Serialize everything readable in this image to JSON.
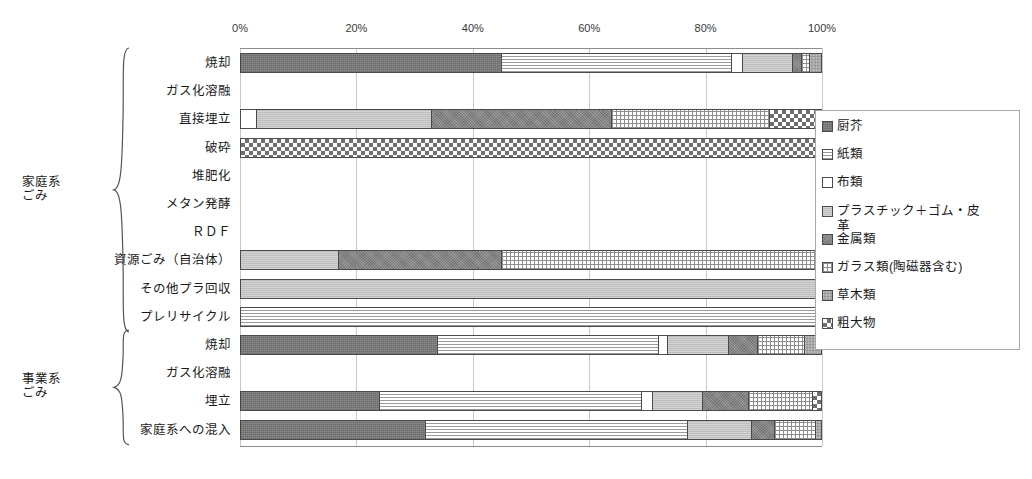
{
  "axis": {
    "tick_labels": [
      "0%",
      "20%",
      "40%",
      "60%",
      "80%",
      "100%"
    ],
    "tick_values": [
      0,
      20,
      40,
      60,
      80,
      100
    ],
    "min": 0,
    "max": 100
  },
  "groups": [
    {
      "label": "家庭系\nごみ",
      "first_row": 0,
      "last_row": 9
    },
    {
      "label": "事業系\nごみ",
      "first_row": 10,
      "last_row": 13
    }
  ],
  "legend": {
    "items": [
      {
        "label": "厨芥",
        "key": "kitchen",
        "swatch": "p-kitchen",
        "color": "#8a8a8a"
      },
      {
        "label": "紙類",
        "key": "paper",
        "swatch": "p-paper",
        "color": "#ffffff"
      },
      {
        "label": "布類",
        "key": "cloth",
        "swatch": "p-cloth",
        "color": "#ffffff"
      },
      {
        "label": "プラスチック＋ゴム・皮\n革",
        "key": "plastic",
        "swatch": "p-plastic",
        "color": "#bdbdbd"
      },
      {
        "label": "金属類",
        "key": "metal",
        "swatch": "p-metal",
        "color": "#9a9a9a"
      },
      {
        "label": "ガラス類(陶磁器含む)",
        "key": "glass",
        "swatch": "p-glass",
        "color": "#ffffff"
      },
      {
        "label": "草木類",
        "key": "wood",
        "swatch": "p-wood",
        "color": "#a8a8a8"
      },
      {
        "label": "粗大物",
        "key": "bulky",
        "swatch": "p-bulky",
        "color": "#6f6f6f"
      }
    ]
  },
  "chart_data": {
    "type": "bar",
    "orientation": "horizontal",
    "stacked": true,
    "normalized_percent": true,
    "title": "",
    "xlabel": "",
    "ylabel": "",
    "xlim": [
      0,
      100
    ],
    "grid": true,
    "legend_position": "right",
    "series": [
      {
        "name": "厨芥",
        "key": "kitchen",
        "values": [
          45.0,
          0,
          0,
          0,
          0,
          0,
          0,
          0,
          0,
          0,
          34.0,
          0,
          24.0,
          32.0
        ]
      },
      {
        "name": "紙類",
        "key": "paper",
        "values": [
          39.5,
          0,
          0,
          0,
          0,
          0,
          0,
          0,
          0,
          100,
          38.0,
          0,
          45.0,
          45.0
        ]
      },
      {
        "name": "布類",
        "key": "cloth",
        "values": [
          2.0,
          0,
          3.0,
          0,
          0,
          0,
          0,
          0,
          0,
          0,
          1.5,
          0,
          2.0,
          0.0
        ]
      },
      {
        "name": "プラスチック＋ゴム・皮革",
        "key": "plastic",
        "swatch": "p-plastic",
        "values": [
          8.5,
          0,
          30.0,
          0,
          0,
          0,
          0,
          17.0,
          100,
          0,
          10.5,
          0,
          8.5,
          11.0
        ]
      },
      {
        "name": "金属類",
        "key": "metal",
        "values": [
          1.5,
          0,
          31.0,
          0,
          0,
          0,
          0,
          28.0,
          0,
          0,
          5.0,
          0,
          8.0,
          4.0
        ]
      },
      {
        "name": "ガラス類(陶磁器含む)",
        "key": "glass",
        "values": [
          1.5,
          0,
          27.0,
          0,
          0,
          0,
          0,
          55.0,
          0,
          0,
          8.0,
          0,
          11.0,
          7.0
        ]
      },
      {
        "name": "草木類",
        "key": "wood",
        "values": [
          2.0,
          0,
          0.0,
          0,
          0,
          0,
          0,
          0,
          0,
          0,
          3.0,
          0,
          0.0,
          1.0
        ]
      },
      {
        "name": "粗大物",
        "key": "bulky",
        "values": [
          0.0,
          0,
          9.0,
          100,
          0,
          0,
          0,
          0,
          0,
          0,
          0.0,
          0,
          1.5,
          0.0
        ]
      }
    ],
    "categories": [
      {
        "label": "焼却",
        "total": 100
      },
      {
        "label": "ガス化溶融",
        "total": 0
      },
      {
        "label": "直接埋立",
        "total": 100
      },
      {
        "label": "破砕",
        "total": 100
      },
      {
        "label": "堆肥化",
        "total": 0
      },
      {
        "label": "メタン発酵",
        "total": 0
      },
      {
        "label": "ＲＤＦ",
        "total": 0
      },
      {
        "label": "資源ごみ（自治体）",
        "total": 100
      },
      {
        "label": "その他プラ回収",
        "total": 100
      },
      {
        "label": "プレリサイクル",
        "total": 100
      },
      {
        "label": "焼却",
        "total": 100
      },
      {
        "label": "ガス化溶融",
        "total": 0
      },
      {
        "label": "埋立",
        "total": 100
      },
      {
        "label": "家庭系への混入",
        "total": 100
      }
    ]
  }
}
